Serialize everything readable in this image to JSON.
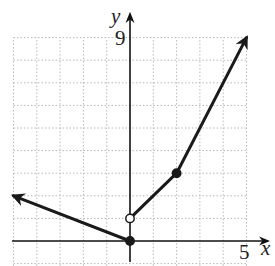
{
  "chart_data": {
    "type": "line",
    "title": "",
    "xlabel": "x",
    "ylabel": "y",
    "xlim": [
      -5,
      5
    ],
    "ylim": [
      -1,
      9
    ],
    "grid": true,
    "tick_labels": {
      "x": [
        "5"
      ],
      "y": [
        "9"
      ]
    },
    "series": [
      {
        "name": "left ray",
        "points": [
          [
            0,
            0
          ],
          [
            -5,
            2
          ]
        ],
        "arrow_at_end": true
      },
      {
        "name": "middle segment",
        "points": [
          [
            0,
            1
          ],
          [
            2,
            3
          ]
        ]
      },
      {
        "name": "right ray",
        "points": [
          [
            2,
            3
          ],
          [
            5,
            9
          ]
        ],
        "arrow_at_end": true
      }
    ],
    "markers": [
      {
        "x": 0,
        "y": 0,
        "style": "closed"
      },
      {
        "x": 0,
        "y": 1,
        "style": "open"
      },
      {
        "x": 2,
        "y": 3,
        "style": "closed"
      }
    ]
  },
  "labels": {
    "x_axis": "x",
    "y_axis": "y",
    "x_tick": "5",
    "y_tick": "9"
  }
}
